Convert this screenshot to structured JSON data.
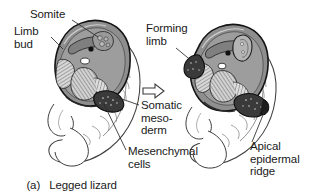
{
  "figure": {
    "caption_tag": "(a)",
    "caption_text": "Legged lizard",
    "transition_arrow": "arrow-right-outline"
  },
  "labels": {
    "somite": "Somite",
    "limb_bud": "Limb\nbud",
    "forming_limb": "Forming\nlimb",
    "somatic_mesoderm": "Somatic\nmeso-\nderm",
    "mesenchymal_cells": "Mesenchymal\ncells",
    "apical_epidermal_ridge": "Apical\nepidermal\nridge"
  },
  "panels": [
    {
      "id": "left-embryo",
      "name": "early-limb-bud-stage",
      "structures": [
        "somite",
        "limb bud",
        "somatic mesoderm",
        "mesenchymal cells",
        "neural tube",
        "notochord",
        "body wall",
        "tail"
      ]
    },
    {
      "id": "right-embryo",
      "name": "forming-limb-stage",
      "structures": [
        "forming limb",
        "apical epidermal ridge",
        "somite",
        "neural tube",
        "notochord",
        "body wall",
        "tail"
      ]
    }
  ],
  "colors": {
    "body_fill": "#8e8e8e",
    "body_fill_light": "#b5b5b5",
    "outline": "#1a1a1a",
    "dark_tissue": "#3c3c3c",
    "cavity": "#ffffff",
    "text": "#1a1a1a",
    "background": "#ffffff"
  }
}
